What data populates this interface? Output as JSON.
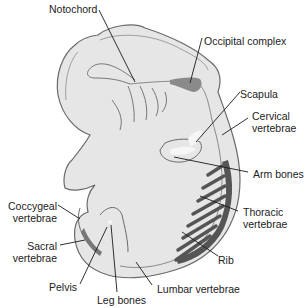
{
  "figure": {
    "colors": {
      "body_fill": "#e6e6e6",
      "body_outline": "#6a6a6a",
      "bone_dark": "#555555",
      "bone_medium": "#8a8a8a",
      "bone_light": "#f6f6f6",
      "leader_line": "#1a1a1a",
      "label_text": "#222222"
    },
    "labels": {
      "notochord": "Notochord",
      "occipital_complex": "Occipital complex",
      "scapula": "Scapula",
      "cervical_1": "Cervical",
      "cervical_2": "vertebrae",
      "arm_bones": "Arm bones",
      "thoracic_1": "Thoracic",
      "thoracic_2": "vertebrae",
      "rib": "Rib",
      "coccygeal_1": "Coccygeal",
      "coccygeal_2": "vertebrae",
      "sacral_1": "Sacral",
      "sacral_2": "vertebrae",
      "pelvis": "Pelvis",
      "lumbar": "Lumbar vertebrae",
      "leg_bones": "Leg bones"
    }
  }
}
